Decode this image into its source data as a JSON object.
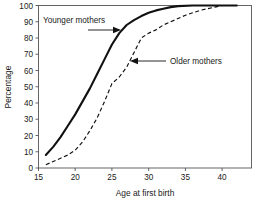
{
  "chart_data": {
    "type": "line",
    "title": "",
    "xlabel": "Age at first birth",
    "ylabel": "Percentage",
    "xlim": [
      15,
      44
    ],
    "ylim": [
      0,
      100
    ],
    "grid": false,
    "legend_position": "inline-annotations",
    "xticks": [
      "15",
      "20",
      "25",
      "30",
      "35",
      "40"
    ],
    "xtick_values": [
      15,
      20,
      25,
      30,
      35,
      40
    ],
    "yticks": [
      "0",
      "10",
      "20",
      "30",
      "40",
      "50",
      "60",
      "70",
      "80",
      "90",
      "100"
    ],
    "ytick_values": [
      0,
      10,
      20,
      30,
      40,
      50,
      60,
      70,
      80,
      90,
      100
    ],
    "series": [
      {
        "name": "Younger mothers",
        "style": "solid",
        "x": [
          16,
          17,
          18,
          19,
          20,
          21,
          22,
          23,
          24,
          25,
          26,
          27,
          28,
          29,
          30,
          31,
          32,
          33,
          34,
          36,
          38,
          40,
          42
        ],
        "values": [
          8,
          13,
          19,
          26,
          33,
          41,
          49,
          58,
          67,
          76,
          83,
          88,
          91,
          93.5,
          95.5,
          97,
          98,
          99,
          99.6,
          100,
          100,
          100,
          100
        ]
      },
      {
        "name": "Older mothers",
        "style": "dashed",
        "x": [
          16,
          17,
          18,
          19,
          20,
          21,
          22,
          23,
          24,
          25,
          26,
          27,
          28,
          29,
          30,
          31,
          32,
          33,
          34,
          35,
          36,
          37,
          38,
          39,
          40,
          42
        ],
        "values": [
          2,
          4,
          6,
          8,
          11,
          16,
          23,
          31,
          41,
          52,
          56,
          62,
          71,
          80,
          83,
          85,
          88,
          90,
          92,
          94,
          95.5,
          97,
          98,
          99,
          100,
          100
        ]
      }
    ],
    "annotations": [
      {
        "text": "Younger mothers",
        "target_series": "Younger mothers",
        "arrow_direction": "right"
      },
      {
        "text": "Older mothers",
        "target_series": "Older mothers",
        "arrow_direction": "left"
      }
    ],
    "colors": {
      "line": "#111111",
      "axis": "#555555",
      "background": "#ffffff"
    }
  }
}
